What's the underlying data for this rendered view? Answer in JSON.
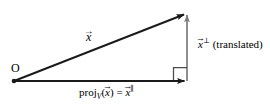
{
  "figure": {
    "name": "orthogonal-projection-diagram",
    "background_color": "#ffffff",
    "width": 270,
    "height": 109,
    "labels": {
      "origin": "O",
      "vector_x_var": "x",
      "vector_x_arrow": "→",
      "x_perp_var": "x",
      "x_perp_sup": "⊥",
      "x_perp_note": "(translated)",
      "proj_name": "proj",
      "proj_subscript": "V",
      "proj_open": "(",
      "proj_arg": "x",
      "proj_close": ")",
      "proj_equals": "=",
      "proj_result_var": "x",
      "proj_result_sup": "∥"
    },
    "colors": {
      "x_vector": "#1a1a1a",
      "proj_vector": "#1a1a1a",
      "perp_vector": "#7a7a7a",
      "right_angle_mark": "#4d4d4d",
      "text": "#000000"
    },
    "geometry": {
      "origin_point": [
        14,
        81
      ],
      "x_vector_tip": [
        187,
        12
      ],
      "proj_vector_tip": [
        187,
        81
      ],
      "perp_vector_base": [
        187,
        81
      ],
      "perp_vector_tip": [
        187,
        12
      ],
      "right_angle_size": 14
    }
  }
}
